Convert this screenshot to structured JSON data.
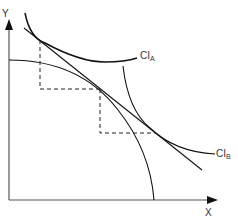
{
  "diagram": {
    "axes": {
      "y_label": "Y",
      "x_label": "X",
      "color": "#555555"
    },
    "curves": {
      "ci_a": {
        "label_main": "CI",
        "label_sub": "A"
      },
      "ci_b": {
        "label_main": "CI",
        "label_sub": "B"
      }
    },
    "colors": {
      "curve": "#111111",
      "dashed": "#222222",
      "text": "#333333"
    }
  }
}
